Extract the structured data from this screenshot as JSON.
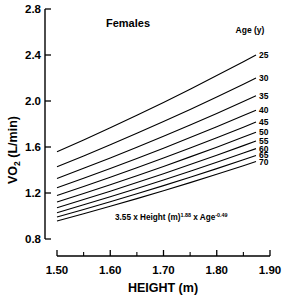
{
  "chart_data": {
    "type": "line",
    "title": "Females",
    "xlabel": "HEIGHT (m)",
    "ylabel": "VO2 (L/min)",
    "ylabel_main": "VO",
    "ylabel_sub": "2",
    "ylabel_unit": " (L/min)",
    "xlim": [
      1.5,
      1.9
    ],
    "ylim": [
      0.8,
      2.8
    ],
    "xticks": [
      1.5,
      1.6,
      1.7,
      1.8,
      1.9
    ],
    "xtick_labels": [
      "1.50",
      "1.60",
      "1.70",
      "1.80",
      "1.90"
    ],
    "xticks_minor": [
      1.55,
      1.65,
      1.75,
      1.85
    ],
    "yticks": [
      0.8,
      1.2,
      1.6,
      2.0,
      2.4,
      2.8
    ],
    "ytick_labels": [
      "0.8",
      "1.2",
      "1.6",
      "2.0",
      "2.4",
      "2.8"
    ],
    "grid": false,
    "legend_position": "right",
    "legend_title": "Age (y)",
    "annotation": {
      "text_parts": [
        "3.55 x Height (m)",
        "1.88",
        " x Age",
        "-0.49"
      ],
      "coefficient": 3.55,
      "height_exponent": 1.88,
      "age_exponent": -0.49,
      "full_text": "3.55 x Height (m) 1.88 x Age -0.49"
    },
    "x": [
      1.5,
      1.55,
      1.6,
      1.65,
      1.7,
      1.75,
      1.8,
      1.85,
      1.9
    ],
    "series": [
      {
        "name": "25",
        "age": 25,
        "values": [
          1.558,
          1.661,
          1.767,
          1.876,
          1.988,
          2.103,
          2.221,
          2.342,
          2.466
        ]
      },
      {
        "name": "30",
        "age": 30,
        "values": [
          1.428,
          1.522,
          1.619,
          1.719,
          1.822,
          1.927,
          2.035,
          2.146,
          2.259
        ]
      },
      {
        "name": "35",
        "age": 35,
        "values": [
          1.327,
          1.415,
          1.505,
          1.598,
          1.693,
          1.791,
          1.892,
          1.995,
          2.1
        ]
      },
      {
        "name": "40",
        "age": 40,
        "values": [
          1.246,
          1.328,
          1.413,
          1.5,
          1.59,
          1.682,
          1.776,
          1.873,
          1.972
        ]
      },
      {
        "name": "45",
        "age": 45,
        "values": [
          1.179,
          1.257,
          1.337,
          1.419,
          1.504,
          1.591,
          1.681,
          1.772,
          1.866
        ]
      },
      {
        "name": "50",
        "age": 50,
        "values": [
          1.121,
          1.195,
          1.272,
          1.35,
          1.431,
          1.514,
          1.598,
          1.686,
          1.775
        ]
      },
      {
        "name": "55",
        "age": 55,
        "values": [
          1.072,
          1.143,
          1.216,
          1.291,
          1.368,
          1.447,
          1.528,
          1.612,
          1.697
        ]
      },
      {
        "name": "60",
        "age": 60,
        "values": [
          1.029,
          1.097,
          1.167,
          1.239,
          1.313,
          1.389,
          1.467,
          1.547,
          1.629
        ]
      },
      {
        "name": "65",
        "age": 65,
        "values": [
          0.991,
          1.056,
          1.124,
          1.193,
          1.264,
          1.337,
          1.412,
          1.489,
          1.568
        ]
      },
      {
        "name": "70",
        "age": 70,
        "values": [
          0.956,
          1.019,
          1.084,
          1.151,
          1.22,
          1.29,
          1.363,
          1.437,
          1.513
        ]
      }
    ]
  },
  "colors": {
    "axis": "#000000",
    "curve": "#000000",
    "background": "#ffffff"
  }
}
